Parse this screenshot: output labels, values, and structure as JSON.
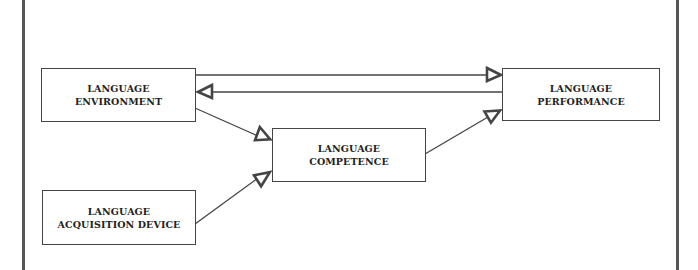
{
  "diagram": {
    "title": "",
    "nodes": [
      {
        "id": "environment",
        "lines": [
          "LANGUAGE",
          "ENVIRONMENT"
        ]
      },
      {
        "id": "performance",
        "lines": [
          "LANGUAGE",
          "PERFORMANCE"
        ]
      },
      {
        "id": "competence",
        "lines": [
          "LANGUAGE",
          "COMPETENCE"
        ]
      },
      {
        "id": "lad",
        "lines": [
          "LANGUAGE",
          "ACQUISITION DEVICE"
        ]
      }
    ],
    "edges": [
      {
        "from": "environment",
        "to": "performance"
      },
      {
        "from": "performance",
        "to": "environment"
      },
      {
        "from": "environment",
        "to": "competence"
      },
      {
        "from": "lad",
        "to": "competence"
      },
      {
        "from": "competence",
        "to": "performance"
      }
    ],
    "colors": {
      "line": "#444444",
      "frame": "#555555",
      "background": "#ffffff"
    }
  }
}
